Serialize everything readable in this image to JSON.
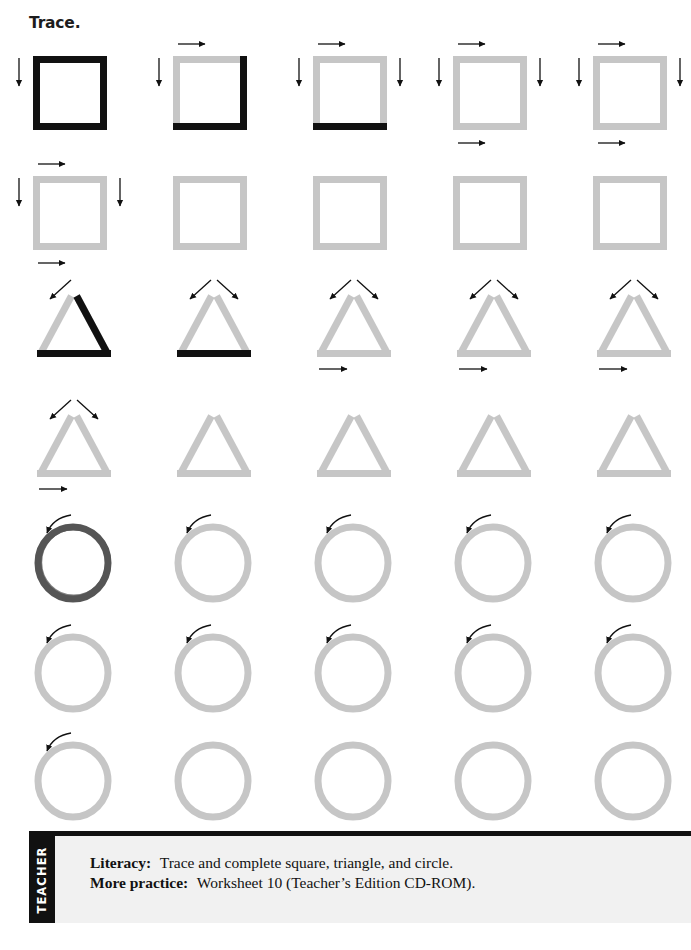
{
  "page": {
    "title": "Trace.",
    "background_color": "#ffffff",
    "width": 691,
    "height": 950
  },
  "palette": {
    "trace_guide_gray": "#c6c6c6",
    "traced_black": "#111111",
    "traced_circle_dark": "#555555",
    "arrow_black": "#111111",
    "footer_panel": "#f1f1f1",
    "footer_bar": "#111111",
    "text_black": "#121212"
  },
  "worksheet": {
    "columns": 5,
    "column_x": [
      29,
      169,
      309,
      449,
      589
    ],
    "row_y": [
      28,
      148,
      268,
      388,
      505,
      615,
      723
    ],
    "rows": [
      {
        "index": 0,
        "shape": "square",
        "cells": [
          {
            "index": 0,
            "shape": "square",
            "traced_sides": [
              "top",
              "left",
              "right",
              "bottom"
            ],
            "arrows": [
              "down-left"
            ]
          },
          {
            "index": 1,
            "shape": "square",
            "traced_sides": [
              "right",
              "bottom"
            ],
            "arrows": [
              "right-top",
              "down-left"
            ]
          },
          {
            "index": 2,
            "shape": "square",
            "traced_sides": [
              "bottom"
            ],
            "arrows": [
              "right-top",
              "down-left",
              "down-right"
            ]
          },
          {
            "index": 3,
            "shape": "square",
            "traced_sides": [],
            "arrows": [
              "right-top",
              "down-left",
              "down-right",
              "right-bottom"
            ]
          },
          {
            "index": 4,
            "shape": "square",
            "traced_sides": [],
            "arrows": [
              "right-top",
              "down-left",
              "down-right",
              "right-bottom"
            ]
          }
        ]
      },
      {
        "index": 1,
        "shape": "square",
        "cells": [
          {
            "index": 0,
            "shape": "square",
            "traced_sides": [],
            "arrows": [
              "right-top",
              "down-left",
              "down-right",
              "right-bottom"
            ]
          },
          {
            "index": 1,
            "shape": "square",
            "traced_sides": [],
            "arrows": []
          },
          {
            "index": 2,
            "shape": "square",
            "traced_sides": [],
            "arrows": []
          },
          {
            "index": 3,
            "shape": "square",
            "traced_sides": [],
            "arrows": []
          },
          {
            "index": 4,
            "shape": "square",
            "traced_sides": [],
            "arrows": []
          }
        ]
      },
      {
        "index": 2,
        "shape": "triangle",
        "cells": [
          {
            "index": 0,
            "shape": "triangle",
            "traced_sides": [
              "right",
              "bottom"
            ],
            "arrows": [
              "diag-left"
            ]
          },
          {
            "index": 1,
            "shape": "triangle",
            "traced_sides": [
              "bottom"
            ],
            "arrows": [
              "diag-left",
              "diag-right"
            ]
          },
          {
            "index": 2,
            "shape": "triangle",
            "traced_sides": [],
            "arrows": [
              "diag-left",
              "diag-right",
              "right-bottom"
            ]
          },
          {
            "index": 3,
            "shape": "triangle",
            "traced_sides": [],
            "arrows": [
              "diag-left",
              "diag-right",
              "right-bottom"
            ]
          },
          {
            "index": 4,
            "shape": "triangle",
            "traced_sides": [],
            "arrows": [
              "diag-left",
              "diag-right",
              "right-bottom"
            ]
          }
        ]
      },
      {
        "index": 3,
        "shape": "triangle",
        "cells": [
          {
            "index": 0,
            "shape": "triangle",
            "traced_sides": [],
            "arrows": [
              "diag-left",
              "diag-right",
              "right-bottom"
            ]
          },
          {
            "index": 1,
            "shape": "triangle",
            "traced_sides": [],
            "arrows": []
          },
          {
            "index": 2,
            "shape": "triangle",
            "traced_sides": [],
            "arrows": []
          },
          {
            "index": 3,
            "shape": "triangle",
            "traced_sides": [],
            "arrows": []
          },
          {
            "index": 4,
            "shape": "triangle",
            "traced_sides": [],
            "arrows": []
          }
        ]
      },
      {
        "index": 4,
        "shape": "circle",
        "cells": [
          {
            "index": 0,
            "shape": "circle",
            "traced": true,
            "arrows": [
              "curve-start"
            ]
          },
          {
            "index": 1,
            "shape": "circle",
            "traced": false,
            "arrows": [
              "curve-start"
            ]
          },
          {
            "index": 2,
            "shape": "circle",
            "traced": false,
            "arrows": [
              "curve-start"
            ]
          },
          {
            "index": 3,
            "shape": "circle",
            "traced": false,
            "arrows": [
              "curve-start"
            ]
          },
          {
            "index": 4,
            "shape": "circle",
            "traced": false,
            "arrows": [
              "curve-start"
            ]
          }
        ]
      },
      {
        "index": 5,
        "shape": "circle",
        "cells": [
          {
            "index": 0,
            "shape": "circle",
            "traced": false,
            "arrows": [
              "curve-start"
            ]
          },
          {
            "index": 1,
            "shape": "circle",
            "traced": false,
            "arrows": [
              "curve-start"
            ]
          },
          {
            "index": 2,
            "shape": "circle",
            "traced": false,
            "arrows": [
              "curve-start"
            ]
          },
          {
            "index": 3,
            "shape": "circle",
            "traced": false,
            "arrows": [
              "curve-start"
            ]
          },
          {
            "index": 4,
            "shape": "circle",
            "traced": false,
            "arrows": [
              "curve-start"
            ]
          }
        ]
      },
      {
        "index": 6,
        "shape": "circle",
        "cells": [
          {
            "index": 0,
            "shape": "circle",
            "traced": false,
            "arrows": [
              "curve-start"
            ]
          },
          {
            "index": 1,
            "shape": "circle",
            "traced": false,
            "arrows": []
          },
          {
            "index": 2,
            "shape": "circle",
            "traced": false,
            "arrows": []
          },
          {
            "index": 3,
            "shape": "circle",
            "traced": false,
            "arrows": []
          },
          {
            "index": 4,
            "shape": "circle",
            "traced": false,
            "arrows": []
          }
        ]
      }
    ]
  },
  "footer": {
    "tab_label": "TEACHER",
    "lines": [
      {
        "label": "Literacy:",
        "text": "Trace and complete square, triangle, and circle."
      },
      {
        "label": "More practice:",
        "text": "Worksheet 10 (Teacher’s Edition CD-ROM)."
      }
    ]
  }
}
